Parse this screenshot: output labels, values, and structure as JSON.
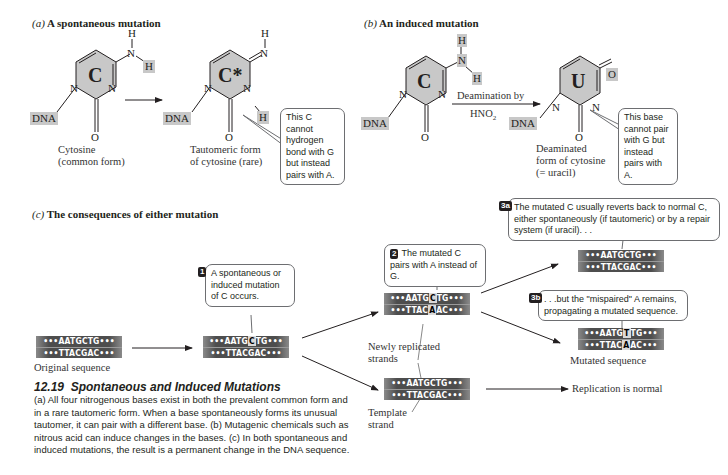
{
  "panel_a": {
    "label": "(a)",
    "title": "A spontaneous mutation",
    "molecule_1": {
      "ring_letter": "C",
      "dna_tag": "DNA",
      "atoms": {
        "h_top": "H",
        "n_amino": "N",
        "h_side": "H",
        "n_ring_left": "N",
        "n_ring_right": "N",
        "o": "O"
      },
      "caption_line1": "Cytosine",
      "caption_line2": "(common form)"
    },
    "molecule_2": {
      "ring_letter": "C*",
      "dna_tag": "DNA",
      "atoms": {
        "h_top": "H",
        "n_imino": "N",
        "n_ring_left": "N",
        "n_ring_right": "N",
        "h_side": "H",
        "o": "O"
      },
      "caption_line1": "Tautomeric form",
      "caption_line2": "of cytosine (rare)"
    },
    "callout": "This C cannot hydrogen bond with G but instead pairs with A."
  },
  "panel_b": {
    "label": "(b)",
    "title": "An induced mutation",
    "molecule_1": {
      "ring_letter": "C",
      "dna_tag": "DNA",
      "atoms": {
        "h_top": "H",
        "n_amino": "N",
        "h_side": "H",
        "n_ring_left": "N",
        "n_ring_right": "N",
        "o": "O"
      }
    },
    "arrow_label_line1": "Deamination by",
    "arrow_label_line2": "HNO",
    "arrow_label_sub": "2",
    "molecule_2": {
      "ring_letter": "U",
      "dna_tag": "DNA",
      "atoms": {
        "o_top": "O",
        "n_ring_left": "N",
        "n_ring_right": "N",
        "o": "O"
      },
      "caption_line1": "Deaminated",
      "caption_line2": "form of cytosine",
      "caption_line3": "(= uracil)"
    },
    "callout": "This base cannot pair with G but instead pairs with A."
  },
  "panel_c": {
    "label": "(c)",
    "title": "The consequences of either mutation",
    "original": {
      "top_pre": "•••AATGCTG•••",
      "bottom": "•••TTACGAC•••",
      "caption": "Original sequence"
    },
    "step1": {
      "number": "1",
      "text": "A spontaneous or induced mutation of C occurs.",
      "top_pre": "•••AATG",
      "top_hl": "C",
      "top_post": "TG•••",
      "bottom": "•••TTACGAC•••"
    },
    "step2": {
      "number": "2",
      "text": "The mutated C pairs with A instead of G.",
      "top_pre": "•••AATG",
      "top_hl": "C",
      "top_post": "TG•••",
      "bottom_pre": "•••TTAC",
      "bottom_hl": "A",
      "bottom_post": "AC•••"
    },
    "step3a": {
      "number": "3a",
      "text": "The mutated C usually reverts back to normal C, either spontaneously (if tautomeric) or by a repair system (if uracil). . .",
      "top": "•••AATGCTG•••",
      "bottom": "•••TTACGAC•••"
    },
    "step3b": {
      "number": "3b",
      "text": ". . .but the \"mispaired\" A remains, propagating a mutated sequence.",
      "top_pre": "•••AATG",
      "top_hl": "T",
      "top_post": "TG•••",
      "bottom_pre": "•••TTAC",
      "bottom_hl": "A",
      "bottom_post": "AC•••",
      "caption": "Mutated sequence"
    },
    "template": {
      "top": "•••AATGCTG•••",
      "bottom": "•••TTACGAC•••",
      "label_line1": "Template",
      "label_line2": "strand"
    },
    "newly_replicated_line1": "Newly replicated",
    "newly_replicated_line2": "strands",
    "normal_label": "Replication is normal"
  },
  "figure_caption": {
    "number": "12.19",
    "title": "Spontaneous and Induced Mutations",
    "body": "(a) All four nitrogenous bases exist in both the prevalent common form and in a rare tautomeric form. When a base spontaneously forms its unusual tautomer, it can pair with a different base. (b) Mutagenic chemicals such as nitrous acid can induce changes in the bases. (c) In both spontaneous and induced mutations, the result is a permanent change in the DNA sequence."
  },
  "colors": {
    "ring_fill": "#c8c8c8",
    "strand_bg": "#4d4d4d",
    "highlight_bg": "#d9d9d9",
    "text": "#231f20"
  }
}
